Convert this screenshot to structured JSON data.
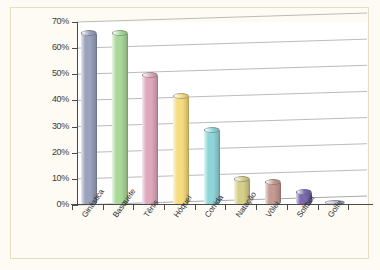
{
  "chart_data": {
    "type": "bar",
    "title": "",
    "subtitle": "",
    "xlabel": "",
    "ylabel": "",
    "categories": [
      "Ginástica",
      "Basquete",
      "Tênis",
      "Hóquei",
      "Corrida",
      "Natação",
      "Vôlei",
      "Softbol",
      "Golfe"
    ],
    "values": [
      67,
      67,
      51,
      43,
      30,
      11,
      10,
      6,
      1
    ],
    "ylim": [
      0,
      70
    ],
    "ytick_labels": [
      "0%",
      "10%",
      "20%",
      "30%",
      "40%",
      "50%",
      "60%",
      "70%"
    ],
    "ytick_values": [
      0,
      10,
      20,
      30,
      40,
      50,
      60,
      70
    ],
    "grid": true,
    "legend": false,
    "legend_position": "none",
    "style": "3d-cylinder",
    "bar_colors": [
      "#9aa3bd",
      "#a9d89a",
      "#dfa9bd",
      "#f5dc7e",
      "#8fd4d8",
      "#d6cf8c",
      "#c49a92",
      "#7a6ab0",
      "#b9b9d4"
    ]
  },
  "frame": {
    "background_color": "#fdfbf4",
    "border_color": "#e6ddc4",
    "plot_background_color": "#ffffff",
    "gridline_color": "#a9a9a9",
    "axis_color": "#4a4a4a",
    "text_color": "#2e2e2e"
  }
}
